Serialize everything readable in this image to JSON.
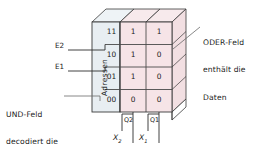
{
  "diagram": {
    "colors": {
      "and_field_fill": "#e8eef2",
      "or_field_fill": "#f6e4e7",
      "top_face_and": "#eef3f6",
      "top_face_or": "#f7eaec",
      "side_face": "#f2dfe2",
      "stroke": "#3a3a3a",
      "leader": "#555555",
      "text": "#1a1a1a"
    },
    "and_field": {
      "column_label": "Adressen",
      "addresses": [
        "11",
        "10",
        "01",
        "00"
      ]
    },
    "or_field": {
      "columns": [
        "Q2",
        "Q1"
      ],
      "rows": [
        {
          "address": "11",
          "values": [
            "1",
            "1"
          ]
        },
        {
          "address": "10",
          "values": [
            "1",
            "0"
          ]
        },
        {
          "address": "01",
          "values": [
            "1",
            "0"
          ]
        },
        {
          "address": "00",
          "values": [
            "0",
            "0"
          ]
        }
      ]
    },
    "inputs": [
      {
        "label": "E2"
      },
      {
        "label": "E1"
      }
    ],
    "outputs": [
      {
        "tap": "Q2",
        "signal": "X",
        "subscript": "2"
      },
      {
        "tap": "Q1",
        "signal": "X",
        "subscript": "1"
      }
    ],
    "annotations": {
      "right": {
        "line1": "ODER-Feld",
        "line2": "enthält die",
        "line3": "Daten"
      },
      "left": {
        "line1": "UND-Feld",
        "line2": "decodiert die",
        "line3": "Adressen"
      }
    }
  }
}
